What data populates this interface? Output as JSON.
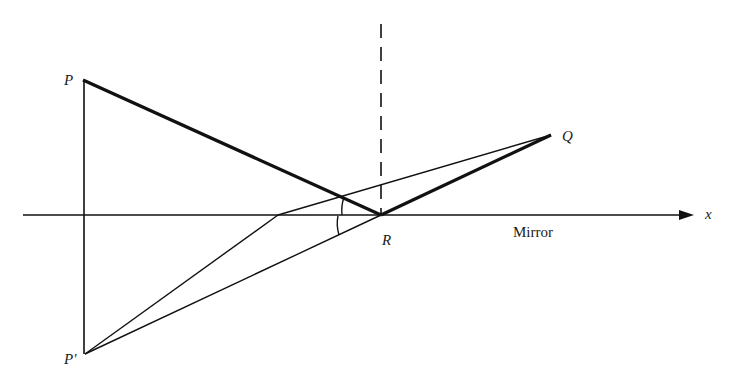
{
  "diagram": {
    "type": "optics-reflection",
    "colors": {
      "ink": "#111111",
      "background": "#ffffff"
    },
    "points": {
      "P": {
        "label": "P",
        "x": 83,
        "y": 80
      },
      "P_prime": {
        "label": "P'",
        "x": 85,
        "y": 354
      },
      "R": {
        "label": "R",
        "x": 381,
        "y": 215
      },
      "Q": {
        "label": "Q",
        "x": 551,
        "y": 135
      },
      "A": {
        "label": "",
        "x": 278,
        "y": 215
      }
    },
    "axis": {
      "label": "x",
      "start_x": 23,
      "end_x": 692,
      "y": 215
    },
    "mirror_label": "Mirror",
    "normal": {
      "style": "dashed",
      "x": 381,
      "y_top": 24,
      "y_bottom": 215
    },
    "segments": [
      {
        "name": "incident-ray",
        "from": "P",
        "to": "R",
        "weight": "bold"
      },
      {
        "name": "reflected-ray",
        "from": "R",
        "to": "Q",
        "weight": "bold"
      },
      {
        "name": "object-image-line",
        "from": "P",
        "to": "P_prime",
        "weight": "thin"
      },
      {
        "name": "image-to-R",
        "from": "P_prime",
        "to": "R",
        "weight": "thin"
      },
      {
        "name": "image-to-A",
        "from": "P_prime",
        "to": "A",
        "weight": "thin"
      },
      {
        "name": "A-to-Q",
        "from": "A",
        "to": "Q",
        "weight": "thin"
      }
    ],
    "angle_marks": [
      {
        "name": "angle-above-mirror",
        "position": "above"
      },
      {
        "name": "angle-below-mirror",
        "position": "below"
      }
    ]
  }
}
